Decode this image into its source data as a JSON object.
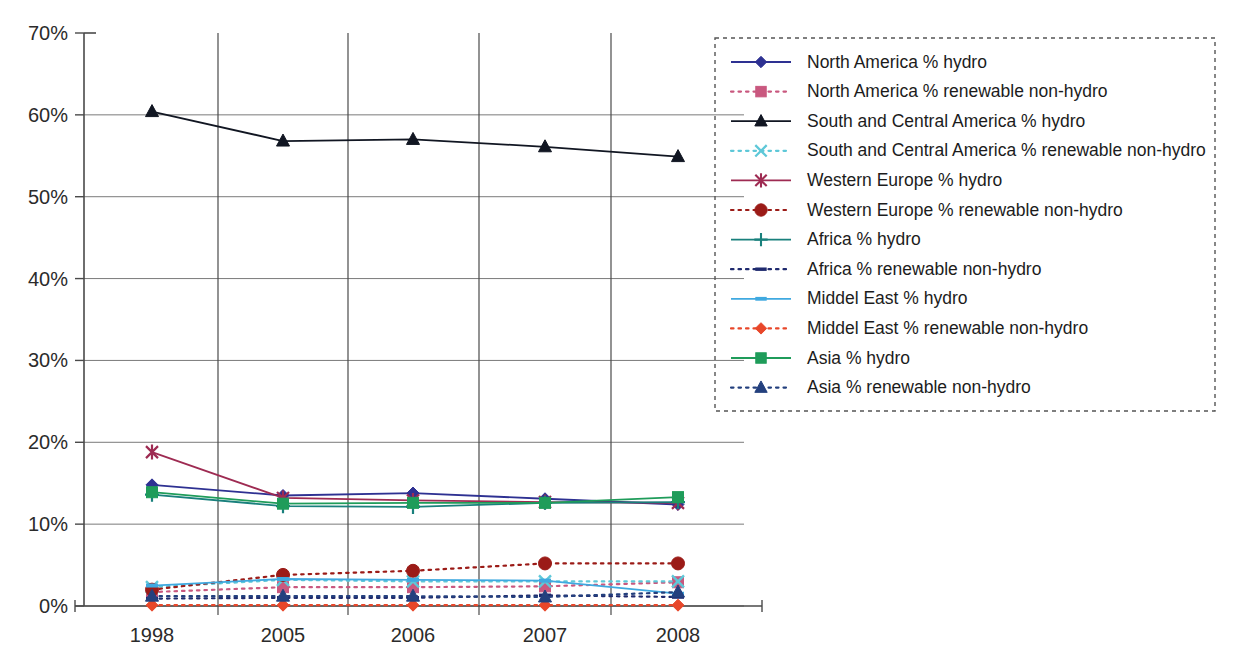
{
  "chart_data": {
    "type": "line",
    "title": "",
    "xlabel": "",
    "ylabel": "",
    "categories": [
      "1998",
      "2005",
      "2006",
      "2007",
      "2008"
    ],
    "x_tick_labels": [
      "1998",
      "2005",
      "2006",
      "2007",
      "2008"
    ],
    "y_tick_labels": [
      "0%",
      "10%",
      "20%",
      "30%",
      "40%",
      "50%",
      "60%",
      "70%"
    ],
    "y_tick_values": [
      0,
      10,
      20,
      30,
      40,
      50,
      60,
      70
    ],
    "ylim": [
      0,
      70
    ],
    "y_unit": "%",
    "grid": "horizontal-and-vertical",
    "legend_position": "right",
    "legend_border": "dashed",
    "series": [
      {
        "name": "North America % hydro",
        "values": [
          14.8,
          13.5,
          13.8,
          13.1,
          12.4
        ],
        "color": "#2e3192",
        "marker": "diamond",
        "dash": "solid"
      },
      {
        "name": "North America % renewable non-hydro",
        "values": [
          1.7,
          2.3,
          2.3,
          2.4,
          2.9
        ],
        "color": "#c9587f",
        "marker": "square",
        "dash": "dotted"
      },
      {
        "name": "South and Central  America % hydro",
        "values": [
          60.4,
          56.8,
          57.0,
          56.1,
          54.9
        ],
        "color": "#111622",
        "marker": "triangle",
        "dash": "solid"
      },
      {
        "name": "South and Central  America % renewable non-hydro",
        "values": [
          2.3,
          3.2,
          3.0,
          3.0,
          3.0
        ],
        "color": "#5ec8d8",
        "marker": "x",
        "dash": "dotted"
      },
      {
        "name": "Western Europe % hydro",
        "values": [
          18.8,
          13.2,
          12.9,
          12.7,
          12.6
        ],
        "color": "#9e2b52",
        "marker": "star",
        "dash": "solid"
      },
      {
        "name": "Western Europe % renewable non-hydro",
        "values": [
          2.0,
          3.8,
          4.3,
          5.2,
          5.2
        ],
        "color": "#9b1b17",
        "marker": "circle",
        "dash": "dotted"
      },
      {
        "name": "Africa % hydro",
        "values": [
          13.6,
          12.2,
          12.1,
          12.6,
          12.7
        ],
        "color": "#19807c",
        "marker": "plus",
        "dash": "solid"
      },
      {
        "name": "Africa % renewable non-hydro",
        "values": [
          0.9,
          1.0,
          1.0,
          1.3,
          1.1
        ],
        "color": "#1f2a6e",
        "marker": "dash",
        "dash": "dotted"
      },
      {
        "name": "Middel East % hydro",
        "values": [
          2.5,
          3.3,
          3.2,
          3.1,
          1.5
        ],
        "color": "#3fa9e0",
        "marker": "line",
        "dash": "solid"
      },
      {
        "name": "Middel East % renewable non-hydro",
        "values": [
          0.1,
          0.1,
          0.1,
          0.1,
          0.1
        ],
        "color": "#e8472a",
        "marker": "diamond",
        "dash": "dotted"
      },
      {
        "name": "Asia % hydro",
        "values": [
          13.9,
          12.5,
          12.6,
          12.6,
          13.3
        ],
        "color": "#1f9c5a",
        "marker": "square",
        "dash": "solid"
      },
      {
        "name": "Asia % renewable non-hydro",
        "values": [
          1.2,
          1.2,
          1.2,
          1.1,
          1.7
        ],
        "color": "#24407e",
        "marker": "triangle",
        "dash": "dotted"
      }
    ]
  },
  "legend": {
    "items": [
      "North America % hydro",
      "North America % renewable non-hydro",
      "South and Central  America % hydro",
      "South and Central  America % renewable non-hydro",
      "Western Europe % hydro",
      "Western Europe % renewable non-hydro",
      "Africa % hydro",
      "Africa % renewable non-hydro",
      "Middel East % hydro",
      "Middel East % renewable non-hydro",
      "Asia % hydro",
      "Asia % renewable non-hydro"
    ]
  }
}
